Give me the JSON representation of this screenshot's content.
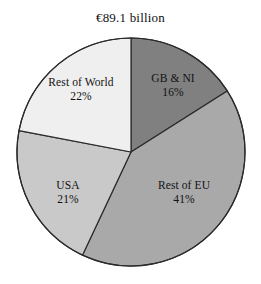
{
  "chart_data": {
    "type": "pie",
    "title": "€89.1 billion",
    "xlabel": "",
    "ylabel": "",
    "legend_position": "none",
    "labels_inside_slices": true,
    "start_angle_deg": 0,
    "direction": "clockwise",
    "categories": [
      "GB & NI",
      "Rest of EU",
      "USA",
      "Rest of World"
    ],
    "values": [
      16,
      41,
      21,
      22
    ],
    "value_suffix": "%",
    "slices": [
      {
        "label": "GB & NI",
        "value": 16,
        "value_text": "16%",
        "color": "#808080"
      },
      {
        "label": "Rest of EU",
        "value": 41,
        "value_text": "41%",
        "color": "#a9a9a9"
      },
      {
        "label": "USA",
        "value": 21,
        "value_text": "21%",
        "color": "#c9c9c9"
      },
      {
        "label": "Rest of World",
        "value": 22,
        "value_text": "22%",
        "color": "#efefef"
      }
    ],
    "outline_color": "#2a2a2a",
    "background_color": "#ffffff"
  },
  "title": {
    "text": "€89.1 billion"
  },
  "labels": {
    "gb_ni": {
      "name": "GB & NI",
      "value": "16%"
    },
    "rest_of_eu": {
      "name": "Rest of EU",
      "value": "41%"
    },
    "usa": {
      "name": "USA",
      "value": "21%"
    },
    "rest_of_world": {
      "name": "Rest of World",
      "value": "22%"
    }
  }
}
